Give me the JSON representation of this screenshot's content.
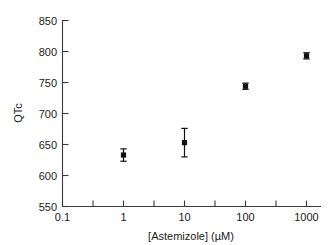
{
  "chart_data": {
    "type": "scatter",
    "title": "",
    "xlabel": "[Astemizole] (µM)",
    "ylabel": "QTc",
    "xscale": "log",
    "yscale": "linear",
    "xlim": [
      0.1,
      1000
    ],
    "ylim": [
      550,
      850
    ],
    "grid": false,
    "legend": null,
    "x_tick_labels": [
      "0.1",
      "1",
      "10",
      "100",
      "1000"
    ],
    "x_tick_values": [
      0.1,
      1,
      10,
      100,
      1000
    ],
    "x_minor_tick_values": [
      0.316,
      3.16,
      31.6,
      316
    ],
    "y_tick_labels": [
      "550",
      "600",
      "650",
      "700",
      "750",
      "800",
      "850"
    ],
    "y_tick_values": [
      550,
      600,
      650,
      700,
      750,
      800,
      850
    ],
    "series": [
      {
        "name": "QTc",
        "marker": "square",
        "color": "#111111",
        "points": [
          {
            "x": 1,
            "y": 633,
            "yerr": 10
          },
          {
            "x": 10,
            "y": 653,
            "yerr": 23
          },
          {
            "x": 100,
            "y": 744,
            "yerr": 5
          },
          {
            "x": 1000,
            "y": 793,
            "yerr": 5
          }
        ]
      }
    ]
  },
  "axes": {
    "x_title": "[Astemizole] (µM)",
    "y_title": "QTc"
  },
  "ticks": {
    "y": [
      "850",
      "800",
      "750",
      "700",
      "650",
      "600",
      "550"
    ],
    "x": [
      "0.1",
      "1",
      "10",
      "100",
      "1000"
    ]
  },
  "colors": {
    "background": "#ffffff",
    "axis": "#3a3a3a",
    "text": "#1a1a1a",
    "marker": "#111111"
  }
}
